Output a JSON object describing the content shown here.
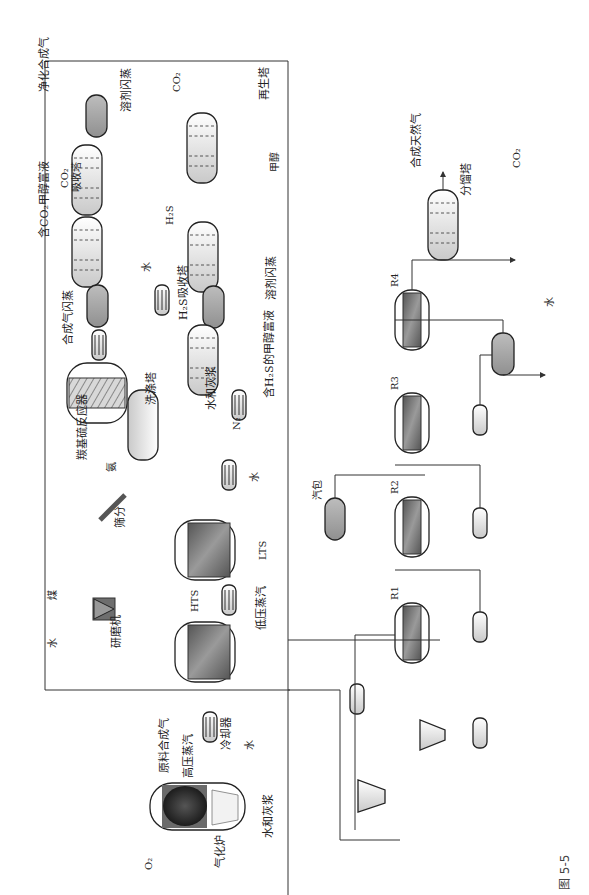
{
  "figure": {
    "caption": "图 5-5",
    "orientation": "rotated 90° counter-clockwise",
    "title_visible": false
  },
  "labels": {
    "gasifier": "气化炉",
    "o2": "O₂",
    "water_ash_slurry_1": "水和灰浆",
    "high_pressure_steam": "高压蒸汽",
    "raw_syngas": "原料合成气",
    "cooler": "冷却器",
    "water_1": "水",
    "grinder": "研磨机",
    "water_grinder": "水",
    "coal": "煤",
    "screening": "筛分",
    "hts": "HTS",
    "low_pressure_steam": "低压蒸汽",
    "lts": "LTS",
    "water_2": "水",
    "ammonia": "氨",
    "cos_reactor": "羰基硫反应器",
    "wash_tower": "洗涤塔",
    "water_ash_slurry_2": "水和灰浆",
    "n2": "N₂",
    "h2s_rich_methanol": "含H₂S的甲醇富液",
    "h2s_absorber": "H₂S吸收塔",
    "syngas_flash": "合成气闪蒸",
    "water_3": "水",
    "solvent_flash_1": "溶剂闪蒸",
    "h2s_out": "H₂S",
    "co2_rich_methanol": "含CO₂甲醇富液",
    "co2_absorber_line1": "CO₂",
    "co2_absorber_line2": "吸收塔",
    "methanol": "甲醇",
    "purified_syngas": "净化合成气",
    "solvent_flash_2": "溶剂闪蒸",
    "co2_out_1": "CO₂",
    "regenerator": "再生塔",
    "steam_drum": "汽包",
    "r1": "R1",
    "r2": "R2",
    "r3": "R3",
    "r4": "R4",
    "water_4": "水",
    "fractionator": "分馏塔",
    "sng": "合成天然气",
    "co2_out_2": "CO₂"
  },
  "colors": {
    "line": "#333333",
    "vessel_light": "#e6e6e6",
    "vessel_dark": "#a8a8a8",
    "reactor_fill": "#7a7a7a",
    "gasifier_dark": "#2b2b2b"
  }
}
